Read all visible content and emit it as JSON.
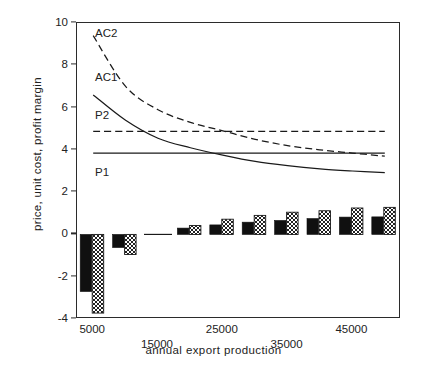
{
  "chart_data": {
    "type": "line",
    "title": "",
    "xlabel": "annual export production",
    "ylabel": "price, unit cost, profit margin",
    "xlim": [
      2500,
      52500
    ],
    "ylim": [
      -4,
      10
    ],
    "grid": false,
    "legend_position": "inline-curve-labels",
    "y_ticks": [
      10,
      8,
      6,
      4,
      2,
      0,
      -2,
      -4
    ],
    "y_tick_labels": [
      "10",
      "8",
      "6",
      "4",
      "2",
      "0",
      "-2",
      "-4"
    ],
    "x_ticks": [
      5000,
      15000,
      25000,
      35000,
      45000
    ],
    "x_tick_labels": [
      "5000",
      "15000",
      "25000",
      "35000",
      "45000"
    ],
    "x": [
      5000,
      10000,
      15000,
      20000,
      25000,
      30000,
      35000,
      40000,
      45000,
      50000
    ],
    "series": [
      {
        "name": "AC2",
        "label": "AC2",
        "style": "dashed",
        "color": "#1a1a1a",
        "values": [
          9.4,
          7.0,
          5.9,
          5.3,
          4.9,
          4.5,
          4.2,
          4.0,
          3.85,
          3.7
        ]
      },
      {
        "name": "AC1",
        "label": "AC1",
        "style": "solid",
        "color": "#1a1a1a",
        "values": [
          6.6,
          5.4,
          4.55,
          4.1,
          3.75,
          3.45,
          3.25,
          3.1,
          3.0,
          2.92
        ]
      },
      {
        "name": "P2",
        "label": "P2",
        "style": "dashed",
        "color": "#1a1a1a",
        "values": [
          4.88,
          4.88,
          4.88,
          4.88,
          4.88,
          4.88,
          4.88,
          4.88,
          4.88,
          4.88
        ]
      },
      {
        "name": "P1",
        "label": "P1",
        "style": "solid",
        "color": "#1a1a1a",
        "values": [
          3.85,
          3.85,
          3.85,
          3.85,
          3.85,
          3.85,
          3.85,
          3.85,
          3.85,
          3.85
        ]
      }
    ],
    "bar_series": [
      {
        "name": "profit-margin-1",
        "fill": "solid-black",
        "color": "#101010",
        "values": [
          -2.7,
          -0.62,
          0.0,
          0.3,
          0.45,
          0.58,
          0.66,
          0.75,
          0.82,
          0.83
        ]
      },
      {
        "name": "profit-margin-2",
        "fill": "checkerboard",
        "color": "#2a2a2a",
        "values": [
          -3.72,
          -0.95,
          0.0,
          0.42,
          0.72,
          0.9,
          1.05,
          1.12,
          1.25,
          1.28
        ]
      }
    ],
    "curve_labels": [
      {
        "text": "AC2",
        "x": 6200,
        "y": 9.45
      },
      {
        "text": "AC1",
        "x": 6200,
        "y": 7.35
      },
      {
        "text": "P2",
        "x": 6200,
        "y": 5.55
      },
      {
        "text": "P1",
        "x": 6200,
        "y": 2.85
      }
    ]
  },
  "axis": {
    "y_title": "price, unit cost, profit margin",
    "x_title": "annual export production"
  }
}
